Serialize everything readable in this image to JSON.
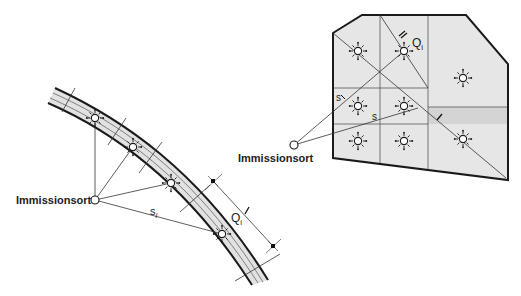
{
  "figure": {
    "left_panel": {
      "title": "Linienquelle (Straße)",
      "receiver_label": "Immissionsort",
      "distance_label": "s",
      "distance_subscript": "i",
      "source_label": "Q",
      "source_subscript": "i",
      "segment_length_label": "l",
      "source_icon": "sun-source-icon",
      "receiver_icon": "open-circle-icon",
      "sources_count": 4
    },
    "right_panel": {
      "title": "Flächenquelle",
      "receiver_label": "Immissionsort",
      "distance_label": "s",
      "distance_label_2": "s",
      "source_label": "Q",
      "source_subscript": "i",
      "segment_length_label": "l",
      "segment_length_label_2": "l",
      "source_icon": "sun-source-icon",
      "receiver_icon": "open-circle-icon",
      "sources_count": 8
    },
    "colors": {
      "line": "#1a1a1a",
      "fill_light": "#e6e6e6",
      "fill_dark": "#d2d2d2",
      "background": "#ffffff"
    }
  }
}
